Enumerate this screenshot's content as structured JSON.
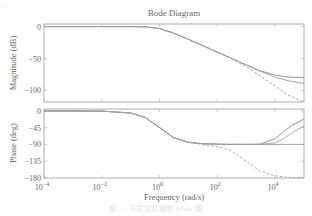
{
  "figure": {
    "corner_label": "(a)",
    "caption": "图 — 不同控制器的 Bode 图"
  },
  "chart_data": [
    {
      "type": "line",
      "panel": "magnitude",
      "title": "Bode Diagram",
      "xlabel": "Frequency (rad/s)",
      "ylabel": "Magnitude (dB)",
      "xscale": "log",
      "xlim": [
        0.0001,
        100000
      ],
      "ylim": [
        -118,
        4
      ],
      "yticks": [
        0,
        -50,
        -100
      ],
      "ytick_labels": [
        "0",
        "−50",
        "−100"
      ],
      "grid": false,
      "x": [
        0.0001,
        0.01,
        0.1,
        0.3,
        1,
        3,
        10,
        30,
        100,
        300,
        1000,
        3000,
        10000,
        30000,
        100000
      ],
      "series": [
        {
          "name": "solid-1",
          "style": "solid",
          "color": "#8a8a8a",
          "values": [
            0,
            0,
            -0.04,
            -0.4,
            -3,
            -10,
            -20,
            -29.5,
            -40,
            -49.5,
            -60,
            -69,
            -76,
            -79,
            -80
          ]
        },
        {
          "name": "solid-2",
          "style": "solid",
          "color": "#9c9c9c",
          "values": [
            0,
            0,
            -0.04,
            -0.4,
            -3,
            -10,
            -20,
            -29.5,
            -40,
            -49.5,
            -60,
            -69.5,
            -79,
            -85,
            -89
          ]
        },
        {
          "name": "dashed",
          "style": "dashed",
          "color": "#a0a0a0",
          "values": [
            0,
            0,
            -0.04,
            -0.4,
            -3,
            -10,
            -20,
            -29.5,
            -40,
            -50,
            -63,
            -77,
            -93,
            -108,
            -118
          ]
        }
      ]
    },
    {
      "type": "line",
      "panel": "phase",
      "xlabel": "Frequency (rad/s)",
      "ylabel": "Phase (deg)",
      "xscale": "log",
      "xlim": [
        0.0001,
        100000
      ],
      "ylim": [
        -180,
        5
      ],
      "yticks": [
        0,
        -45,
        -90,
        -135,
        -180
      ],
      "ytick_labels": [
        "0",
        "−45",
        "−90",
        "−135",
        "−180"
      ],
      "xticks": [
        0.0001,
        0.01,
        1,
        100,
        10000
      ],
      "xtick_labels": [
        {
          "base": "10",
          "exp": "−4"
        },
        {
          "base": "10",
          "exp": "−2"
        },
        {
          "base": "10",
          "exp": "0"
        },
        {
          "base": "10",
          "exp": "2"
        },
        {
          "base": "10",
          "exp": "4"
        }
      ],
      "grid": false,
      "x": [
        0.0001,
        0.01,
        0.1,
        0.3,
        1,
        3,
        10,
        30,
        100,
        300,
        1000,
        3000,
        10000,
        20000,
        40000,
        100000
      ],
      "series": [
        {
          "name": "solid-1",
          "style": "solid",
          "color": "#8a8a8a",
          "values": [
            0,
            -0.6,
            -5.7,
            -16.7,
            -45,
            -71.6,
            -84.3,
            -88,
            -89.4,
            -89.8,
            -90,
            -89,
            -75,
            -55,
            -38,
            -22
          ]
        },
        {
          "name": "solid-2",
          "style": "solid",
          "color": "#a8a8a8",
          "values": [
            0,
            -0.6,
            -5.7,
            -16.7,
            -45,
            -71.6,
            -84.3,
            -88,
            -89.4,
            -89.8,
            -90,
            -89.8,
            -86,
            -74,
            -58,
            -40
          ]
        },
        {
          "name": "flat",
          "style": "solid",
          "color": "#9a9a9a",
          "values": [
            0,
            -0.6,
            -5.7,
            -16.7,
            -45,
            -71.6,
            -84.3,
            -88,
            -89.4,
            -89.8,
            -90,
            -90,
            -90,
            -90,
            -90,
            -90
          ]
        },
        {
          "name": "dashed",
          "style": "dashed",
          "color": "#a0a0a0",
          "values": [
            0,
            -0.6,
            -5.7,
            -16.7,
            -45,
            -71.6,
            -84.9,
            -90,
            -95.7,
            -106.7,
            -135,
            -161.6,
            -174,
            -177,
            -178.6,
            -179.4
          ]
        }
      ]
    }
  ]
}
